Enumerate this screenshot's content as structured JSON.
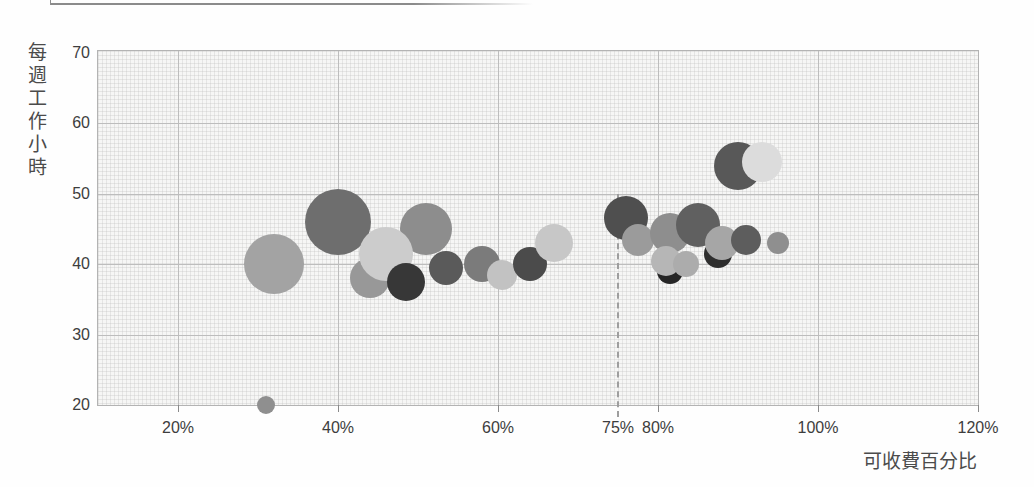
{
  "chart_data": {
    "type": "scatter",
    "subtype": "bubble",
    "title": "",
    "xlabel": "可收費百分比",
    "ylabel": "每週工作小時",
    "xlim": [
      10,
      120
    ],
    "ylim": [
      20,
      70
    ],
    "grid": true,
    "x_unit": "percent",
    "y_unit": "hours",
    "x_ticks": [
      {
        "value": 20,
        "label": "20%"
      },
      {
        "value": 40,
        "label": "40%"
      },
      {
        "value": 60,
        "label": "60%"
      },
      {
        "value": 75,
        "label": "75%"
      },
      {
        "value": 80,
        "label": "80%"
      },
      {
        "value": 100,
        "label": "100%"
      },
      {
        "value": 120,
        "label": "120%"
      }
    ],
    "y_ticks": [
      {
        "value": 20,
        "label": "20"
      },
      {
        "value": 30,
        "label": "30"
      },
      {
        "value": 40,
        "label": "40"
      },
      {
        "value": 50,
        "label": "50"
      },
      {
        "value": 60,
        "label": "60"
      },
      {
        "value": 70,
        "label": "70"
      }
    ],
    "x_gridlines": [
      20,
      40,
      60,
      80,
      100
    ],
    "y_gridlines": [
      30,
      40,
      50,
      60
    ],
    "reference_line": {
      "axis": "x",
      "value": 75,
      "label": "75%",
      "style": "dashed",
      "color": "#9e9e9e",
      "from_y": 50,
      "to_below_axis_px": 12
    },
    "points": [
      {
        "x": 40,
        "y": 46,
        "r": 33,
        "color": "#6e6e6e"
      },
      {
        "x": 51,
        "y": 45,
        "r": 26,
        "color": "#8d8d8d"
      },
      {
        "x": 32,
        "y": 40,
        "r": 30,
        "color": "#a3a3a3"
      },
      {
        "x": 44,
        "y": 38,
        "r": 20,
        "color": "#989898"
      },
      {
        "x": 46,
        "y": 41.5,
        "r": 27,
        "color": "#cccccc"
      },
      {
        "x": 48.5,
        "y": 37.5,
        "r": 19,
        "color": "#373737"
      },
      {
        "x": 53.5,
        "y": 39.5,
        "r": 17,
        "color": "#5a5a5a"
      },
      {
        "x": 58,
        "y": 40,
        "r": 18,
        "color": "#7b7b7b"
      },
      {
        "x": 60.5,
        "y": 38.5,
        "r": 15,
        "color": "#c2c2c2"
      },
      {
        "x": 64,
        "y": 40,
        "r": 17,
        "color": "#4b4b4b"
      },
      {
        "x": 67,
        "y": 43,
        "r": 19,
        "color": "#c7c7c7"
      },
      {
        "x": 31,
        "y": 20,
        "r": 9,
        "color": "#8f8f8f"
      },
      {
        "x": 76,
        "y": 46.5,
        "r": 22,
        "color": "#4f4f4f"
      },
      {
        "x": 77.5,
        "y": 43.5,
        "r": 16,
        "color": "#9b9b9b"
      },
      {
        "x": 81.5,
        "y": 44.5,
        "r": 20,
        "color": "#8e8e8e"
      },
      {
        "x": 85,
        "y": 45.5,
        "r": 22,
        "color": "#606060"
      },
      {
        "x": 81.5,
        "y": 39,
        "r": 13,
        "color": "#262626"
      },
      {
        "x": 81,
        "y": 40.5,
        "r": 15,
        "color": "#b6b6b6"
      },
      {
        "x": 83.5,
        "y": 40,
        "r": 13,
        "color": "#acacac"
      },
      {
        "x": 87.5,
        "y": 41.5,
        "r": 14,
        "color": "#2e2e2e"
      },
      {
        "x": 88,
        "y": 43,
        "r": 17,
        "color": "#a6a6a6"
      },
      {
        "x": 91,
        "y": 43.5,
        "r": 15,
        "color": "#5d5d5d"
      },
      {
        "x": 95,
        "y": 43,
        "r": 11,
        "color": "#8f8f8f"
      },
      {
        "x": 90,
        "y": 54,
        "r": 24,
        "color": "#585858"
      },
      {
        "x": 93,
        "y": 54.5,
        "r": 20,
        "color": "#dcdcdc"
      }
    ],
    "colors": {
      "gridline": "#bdbdbd",
      "plot_background": "#f6f6f5",
      "axis_text": "#3d3d3d",
      "axis_title_text": "#4b4b4b"
    }
  }
}
